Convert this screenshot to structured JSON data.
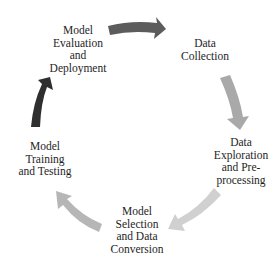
{
  "diagram": {
    "type": "cycle",
    "stages": [
      {
        "id": "evaluation",
        "lines": [
          "Model",
          "Evaluation",
          "and",
          "Deployment"
        ]
      },
      {
        "id": "collection",
        "lines": [
          "Data",
          "Collection"
        ]
      },
      {
        "id": "exploration",
        "lines": [
          "Data",
          "Exploration",
          "and Pre-",
          "processing"
        ]
      },
      {
        "id": "selection",
        "lines": [
          "Model",
          "Selection",
          "and Data",
          "Conversion"
        ]
      },
      {
        "id": "training",
        "lines": [
          "Model",
          "Training",
          "and Testing"
        ]
      }
    ],
    "arrows": [
      {
        "from": "evaluation",
        "to": "collection",
        "color": "#5c5c5c"
      },
      {
        "from": "collection",
        "to": "exploration",
        "color": "#a9a9a9"
      },
      {
        "from": "exploration",
        "to": "selection",
        "color": "#d0d0d0"
      },
      {
        "from": "selection",
        "to": "training",
        "color": "#b6b6b6"
      },
      {
        "from": "training",
        "to": "evaluation",
        "color": "#2f2f2f"
      }
    ]
  }
}
